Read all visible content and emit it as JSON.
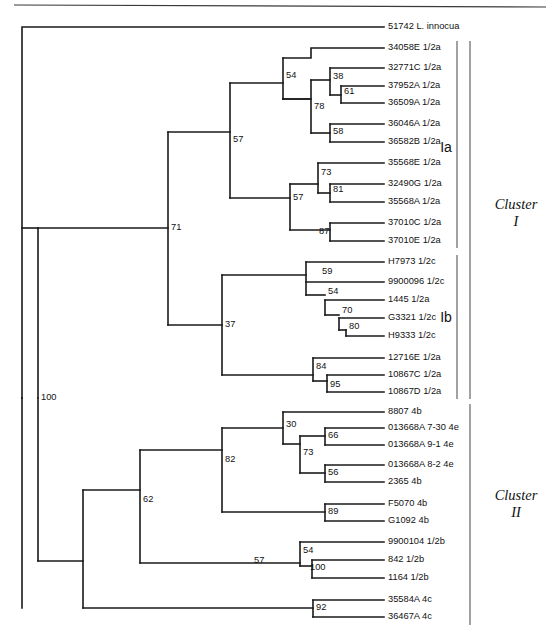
{
  "figure": {
    "kind": "phylogenetic-tree",
    "width": 557,
    "height": 634,
    "top_rule_visible": true,
    "line_color": "#1a1a1a",
    "text_color": "#111111",
    "bracket_color": "#555555"
  },
  "tips": [
    {
      "id": "t0",
      "label": "51742 L. innocua",
      "x": 388,
      "y": 27
    },
    {
      "id": "t1",
      "label": "34058E 1/2a",
      "x": 388,
      "y": 48
    },
    {
      "id": "t2",
      "label": "32771C 1/2a",
      "x": 388,
      "y": 68
    },
    {
      "id": "t3",
      "label": "37952A 1/2a",
      "x": 388,
      "y": 86
    },
    {
      "id": "t4",
      "label": "36509A 1/2a",
      "x": 388,
      "y": 103
    },
    {
      "id": "t5",
      "label": "36046A 1/2a",
      "x": 388,
      "y": 124
    },
    {
      "id": "t6",
      "label": "36582B 1/2a",
      "x": 388,
      "y": 142
    },
    {
      "id": "t7",
      "label": "35568E 1/2a",
      "x": 388,
      "y": 163
    },
    {
      "id": "t8",
      "label": "32490G 1/2a",
      "x": 388,
      "y": 184
    },
    {
      "id": "t9",
      "label": "35568A 1/2a",
      "x": 388,
      "y": 202
    },
    {
      "id": "t10",
      "label": "37010C 1/2a",
      "x": 388,
      "y": 223
    },
    {
      "id": "t11",
      "label": "37010E 1/2a",
      "x": 388,
      "y": 241
    },
    {
      "id": "t12",
      "label": "H7973 1/2c",
      "x": 388,
      "y": 262
    },
    {
      "id": "t13",
      "label": "9900096 1/2c",
      "x": 388,
      "y": 282
    },
    {
      "id": "t14",
      "label": "1445 1/2a",
      "x": 388,
      "y": 300
    },
    {
      "id": "t15",
      "label": "G3321 1/2c",
      "x": 388,
      "y": 318
    },
    {
      "id": "t16",
      "label": "H9333 1/2c",
      "x": 388,
      "y": 336
    },
    {
      "id": "t17",
      "label": "12716E 1/2a",
      "x": 388,
      "y": 358
    },
    {
      "id": "t18",
      "label": "10867C 1/2a",
      "x": 388,
      "y": 375
    },
    {
      "id": "t19",
      "label": "10867D 1/2a",
      "x": 388,
      "y": 392
    },
    {
      "id": "t20",
      "label": "8807 4b",
      "x": 388,
      "y": 412
    },
    {
      "id": "t21",
      "label": "013668A 7-30 4e",
      "x": 388,
      "y": 428
    },
    {
      "id": "t22",
      "label": "013668A 9-1 4e",
      "x": 388,
      "y": 445
    },
    {
      "id": "t23",
      "label": "013668A 8-2 4e",
      "x": 388,
      "y": 465
    },
    {
      "id": "t24",
      "label": "2365 4b",
      "x": 388,
      "y": 482
    },
    {
      "id": "t25",
      "label": "F5070 4b",
      "x": 388,
      "y": 504
    },
    {
      "id": "t26",
      "label": "G1092 4b",
      "x": 388,
      "y": 521
    },
    {
      "id": "t27",
      "label": "9900104 1/2b",
      "x": 388,
      "y": 542
    },
    {
      "id": "t28",
      "label": "842 1/2b",
      "x": 388,
      "y": 560
    },
    {
      "id": "t29",
      "label": "1164 1/2b",
      "x": 388,
      "y": 578
    },
    {
      "id": "t30",
      "label": "35584A 4c",
      "x": 388,
      "y": 600
    },
    {
      "id": "t31",
      "label": "36467A 4c",
      "x": 388,
      "y": 617
    }
  ],
  "branches": [
    {
      "name": "root-stem",
      "d": "M 22 608 L 22 398"
    },
    {
      "name": "root-to-innocua",
      "d": "M 22 398 L 22 27 L 384 27"
    },
    {
      "name": "node100-v",
      "d": "M 22 398 L 22 398"
    },
    {
      "name": "cluster1-stem",
      "d": "M 22 228 L 38 228"
    },
    {
      "name": "n100-bar",
      "d": "M 38 228 L 38 398"
    },
    {
      "name": "n100-to-cluster2",
      "d": "M 38 398 L 38 561"
    },
    {
      "name": "n71-stem",
      "d": "M 38 228 L 168 228"
    },
    {
      "name": "n71-vert",
      "d": "M 168 132 L 168 325"
    },
    {
      "name": "n57a-stem",
      "d": "M 168 132 L 230 132"
    },
    {
      "name": "n57a-vert",
      "d": "M 230 83 L 230 198"
    },
    {
      "name": "n54-stem",
      "d": "M 230 83 L 283 83"
    },
    {
      "name": "n54-vert",
      "d": "M 283 58 L 283 99"
    },
    {
      "name": "n54-to-t1",
      "d": "M 283 58 L 311 58 L 311 48 L 384 48"
    },
    {
      "name": "n78-stem",
      "d": "M 283 99 L 283 99"
    },
    {
      "name": "n78-vert",
      "d": "M 283 99 L 283 99"
    },
    {
      "name": "n78-upper",
      "d": "M 283 99 L 311 99 L 311 80"
    },
    {
      "name": "n38-stem",
      "d": "M 311 80 L 330 80"
    },
    {
      "name": "n38-vert",
      "d": "M 330 68 L 330 95"
    },
    {
      "name": "n38-to-t2",
      "d": "M 330 68 L 384 68"
    },
    {
      "name": "n61-stem",
      "d": "M 330 95 L 341 95"
    },
    {
      "name": "n61-vert",
      "d": "M 341 86 L 341 103"
    },
    {
      "name": "n61-to-t3",
      "d": "M 341 86 L 384 86"
    },
    {
      "name": "n61-to-t4",
      "d": "M 341 103 L 384 103"
    },
    {
      "name": "n78-lower",
      "d": "M 283 99 L 311 99 L 311 133"
    },
    {
      "name": "n58-stem",
      "d": "M 311 133 L 330 133"
    },
    {
      "name": "n58-vert",
      "d": "M 330 124 L 330 142"
    },
    {
      "name": "n58-to-t5",
      "d": "M 330 124 L 384 124"
    },
    {
      "name": "n58-to-t6",
      "d": "M 330 142 L 384 142"
    },
    {
      "name": "n57b-stem",
      "d": "M 230 198 L 290 198"
    },
    {
      "name": "n57b-vert",
      "d": "M 290 184 L 290 230"
    },
    {
      "name": "n73-stem",
      "d": "M 290 184 L 318 184"
    },
    {
      "name": "n73-vert",
      "d": "M 318 163 L 318 193"
    },
    {
      "name": "n73-to-t7",
      "d": "M 318 163 L 384 163"
    },
    {
      "name": "n81-stem",
      "d": "M 318 193 L 330 193"
    },
    {
      "name": "n81-vert",
      "d": "M 330 184 L 330 202"
    },
    {
      "name": "n81-to-t8",
      "d": "M 330 184 L 384 184"
    },
    {
      "name": "n81-to-t9",
      "d": "M 330 202 L 384 202"
    },
    {
      "name": "n87-stem",
      "d": "M 290 230 L 330 230"
    },
    {
      "name": "n87-vert",
      "d": "M 330 223 L 330 241"
    },
    {
      "name": "n87-to-t10",
      "d": "M 330 223 L 384 223"
    },
    {
      "name": "n87-to-t11",
      "d": "M 330 241 L 384 241"
    },
    {
      "name": "n37-stem",
      "d": "M 168 325 L 222 325"
    },
    {
      "name": "n37-vert",
      "d": "M 222 275 L 222 375"
    },
    {
      "name": "n59-stem",
      "d": "M 222 275 L 306 275"
    },
    {
      "name": "n59-vert",
      "d": "M 306 262 L 306 295"
    },
    {
      "name": "n59-to-t12",
      "d": "M 306 262 L 384 262"
    },
    {
      "name": "n59-to-t13",
      "d": "M 306 282 L 384 282"
    },
    {
      "name": "n54b-stem",
      "d": "M 306 295 L 325 295"
    },
    {
      "name": "n54b-vert",
      "d": "M 325 300 L 325 315"
    },
    {
      "name": "n54b-to-t14",
      "d": "M 325 300 L 384 300"
    },
    {
      "name": "n70-stem",
      "d": "M 325 315 L 339 315"
    },
    {
      "name": "n70-vert",
      "d": "M 339 318 L 339 330"
    },
    {
      "name": "n70-to-t15",
      "d": "M 339 318 L 384 318"
    },
    {
      "name": "n80-stem",
      "d": "M 339 330 L 346 330"
    },
    {
      "name": "n80-vert",
      "d": "M 346 330 L 346 336"
    },
    {
      "name": "n80-to-t16",
      "d": "M 346 336 L 384 336"
    },
    {
      "name": "n84-stem",
      "d": "M 222 375 L 313 375"
    },
    {
      "name": "n84-vert",
      "d": "M 313 358 L 313 381"
    },
    {
      "name": "n84-to-t17",
      "d": "M 313 358 L 384 358"
    },
    {
      "name": "n95-stem",
      "d": "M 313 381 L 327 381"
    },
    {
      "name": "n95-vert",
      "d": "M 327 375 L 327 392"
    },
    {
      "name": "n95-to-t18",
      "d": "M 327 375 L 384 375"
    },
    {
      "name": "n95-to-t19",
      "d": "M 327 392 L 384 392"
    },
    {
      "name": "n57c-stem",
      "d": "M 38 561 L 83 561"
    },
    {
      "name": "n57c-vert",
      "d": "M 83 490 L 83 608"
    },
    {
      "name": "n62-stem",
      "d": "M 83 490 L 140 490"
    },
    {
      "name": "n62-vert",
      "d": "M 140 450 L 140 563"
    },
    {
      "name": "n82-stem",
      "d": "M 140 450 L 222 450"
    },
    {
      "name": "n82-vert",
      "d": "M 222 428 L 222 512"
    },
    {
      "name": "n30-stem",
      "d": "M 222 428 L 283 428"
    },
    {
      "name": "n30-vert",
      "d": "M 283 412 L 283 444"
    },
    {
      "name": "n30-to-t20",
      "d": "M 283 412 L 384 412"
    },
    {
      "name": "n73b-stem",
      "d": "M 283 444 L 300 444"
    },
    {
      "name": "n73b-vert",
      "d": "M 300 436 L 300 473"
    },
    {
      "name": "n66-stem",
      "d": "M 300 436 L 325 436"
    },
    {
      "name": "n66-vert",
      "d": "M 325 428 L 325 445"
    },
    {
      "name": "n66-to-t21",
      "d": "M 325 428 L 384 428"
    },
    {
      "name": "n66-to-t22",
      "d": "M 325 445 L 384 445"
    },
    {
      "name": "n56-stem",
      "d": "M 300 473 L 325 473"
    },
    {
      "name": "n56-vert",
      "d": "M 325 465 L 325 482"
    },
    {
      "name": "n56-to-t23",
      "d": "M 325 465 L 384 465"
    },
    {
      "name": "n56-to-t24",
      "d": "M 325 482 L 384 482"
    },
    {
      "name": "n89-stem",
      "d": "M 222 512 L 325 512"
    },
    {
      "name": "n89-vert",
      "d": "M 325 504 L 325 521"
    },
    {
      "name": "n89-to-t25",
      "d": "M 325 504 L 384 504"
    },
    {
      "name": "n89-to-t26",
      "d": "M 325 521 L 384 521"
    },
    {
      "name": "n54c-stem",
      "d": "M 140 563 L 300 563"
    },
    {
      "name": "n54c-vert",
      "d": "M 300 542 L 300 566"
    },
    {
      "name": "n54c-to-t27",
      "d": "M 300 542 L 384 542"
    },
    {
      "name": "n100b-stem",
      "d": "M 300 566 L 312 566"
    },
    {
      "name": "n100b-vert",
      "d": "M 312 560 L 312 578"
    },
    {
      "name": "n100b-to-t28",
      "d": "M 312 560 L 384 560"
    },
    {
      "name": "n100b-to-t29",
      "d": "M 312 578 L 384 578"
    },
    {
      "name": "n92-stem",
      "d": "M 83 608 L 313 608"
    },
    {
      "name": "n92-vert",
      "d": "M 313 600 L 313 617"
    },
    {
      "name": "n92-to-t30",
      "d": "M 313 600 L 384 600"
    },
    {
      "name": "n92-to-t31",
      "d": "M 313 617 L 384 617"
    }
  ],
  "bootstrap_values": [
    {
      "value": "54",
      "x": 286,
      "y": 76,
      "anchor": "start"
    },
    {
      "value": "38",
      "x": 333,
      "y": 77,
      "anchor": "start"
    },
    {
      "value": "61",
      "x": 344,
      "y": 92,
      "anchor": "start"
    },
    {
      "value": "78",
      "x": 314,
      "y": 107,
      "anchor": "start"
    },
    {
      "value": "58",
      "x": 333,
      "y": 132,
      "anchor": "start"
    },
    {
      "value": "57",
      "x": 233,
      "y": 140,
      "anchor": "start"
    },
    {
      "value": "73",
      "x": 321,
      "y": 173,
      "anchor": "start"
    },
    {
      "value": "81",
      "x": 333,
      "y": 190,
      "anchor": "start"
    },
    {
      "value": "57",
      "x": 293,
      "y": 198,
      "anchor": "start"
    },
    {
      "value": "87",
      "x": 319,
      "y": 232,
      "anchor": "start"
    },
    {
      "value": "71",
      "x": 171,
      "y": 228,
      "anchor": "start"
    },
    {
      "value": "59",
      "x": 322,
      "y": 272,
      "anchor": "start"
    },
    {
      "value": "54",
      "x": 328,
      "y": 292,
      "anchor": "start"
    },
    {
      "value": "70",
      "x": 342,
      "y": 311,
      "anchor": "start"
    },
    {
      "value": "80",
      "x": 349,
      "y": 327,
      "anchor": "start"
    },
    {
      "value": "37",
      "x": 225,
      "y": 325,
      "anchor": "start"
    },
    {
      "value": "84",
      "x": 316,
      "y": 367,
      "anchor": "start"
    },
    {
      "value": "95",
      "x": 330,
      "y": 385,
      "anchor": "start"
    },
    {
      "value": "100",
      "x": 41,
      "y": 398,
      "anchor": "start"
    },
    {
      "value": "30",
      "x": 286,
      "y": 425,
      "anchor": "start"
    },
    {
      "value": "66",
      "x": 328,
      "y": 436,
      "anchor": "start"
    },
    {
      "value": "73",
      "x": 303,
      "y": 453,
      "anchor": "start"
    },
    {
      "value": "56",
      "x": 328,
      "y": 473,
      "anchor": "start"
    },
    {
      "value": "82",
      "x": 225,
      "y": 460,
      "anchor": "start"
    },
    {
      "value": "89",
      "x": 328,
      "y": 512,
      "anchor": "start"
    },
    {
      "value": "62",
      "x": 143,
      "y": 500,
      "anchor": "start"
    },
    {
      "value": "54",
      "x": 303,
      "y": 551,
      "anchor": "start"
    },
    {
      "value": "100",
      "x": 310,
      "y": 568,
      "anchor": "start"
    },
    {
      "value": "57",
      "x": 254,
      "y": 561,
      "anchor": "start"
    },
    {
      "value": "92",
      "x": 316,
      "y": 608,
      "anchor": "start"
    }
  ],
  "subclade_brackets": [
    {
      "label": "Ia",
      "bar_x": 457,
      "bar_y1": 41,
      "bar_y2": 248,
      "label_x": 446,
      "label_y": 148
    },
    {
      "label": "Ib",
      "bar_x": 457,
      "bar_y1": 255,
      "bar_y2": 399,
      "label_x": 446,
      "label_y": 318
    }
  ],
  "cluster_brackets": [
    {
      "name": "Cluster",
      "numeral": "I",
      "bar_x": 470,
      "bar_y1": 41,
      "bar_y2": 399,
      "label_x": 516,
      "label_y_line1": 209,
      "label_y_line2": 226
    },
    {
      "name": "Cluster",
      "numeral": "II",
      "bar_x": 470,
      "bar_y1": 404,
      "bar_y2": 625,
      "label_x": 516,
      "label_y_line1": 500,
      "label_y_line2": 517
    }
  ],
  "top_rule": {
    "x1": 14,
    "y1": 5,
    "x2": 546,
    "y2": 7
  }
}
